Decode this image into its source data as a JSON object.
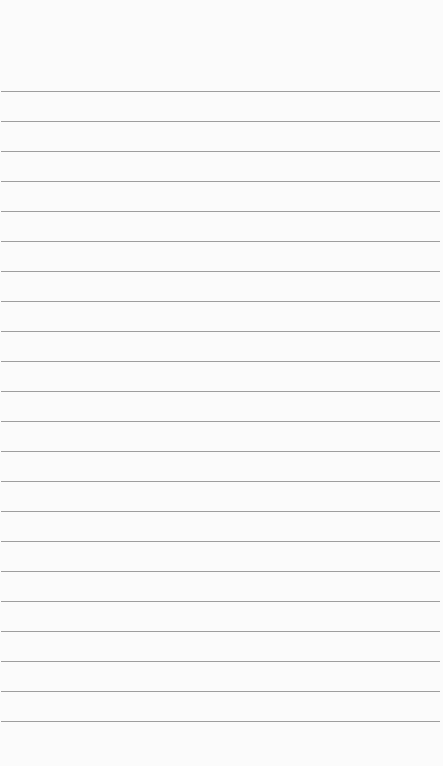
{
  "notepad": {
    "title": "",
    "line_count": 22,
    "first_line_y": 91,
    "line_spacing": 30,
    "line_color": "#9e9e9e",
    "background_color": "#fbfbfb",
    "lines": [
      "",
      "",
      "",
      "",
      "",
      "",
      "",
      "",
      "",
      "",
      "",
      "",
      "",
      "",
      "",
      "",
      "",
      "",
      "",
      "",
      "",
      ""
    ]
  }
}
